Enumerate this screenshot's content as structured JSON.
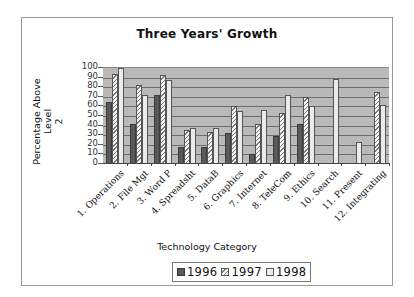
{
  "chart_data": {
    "type": "bar",
    "title": "Three Years' Growth",
    "xlabel": "Technology Category",
    "ylabel": "Percentage Above Level 2",
    "ylim": [
      0,
      100
    ],
    "yticks": [
      0,
      10,
      20,
      30,
      40,
      50,
      60,
      70,
      80,
      90,
      100
    ],
    "grid": true,
    "legend_position": "bottom",
    "categories": [
      "1. Operations",
      "2. File Mgt",
      "3. Word P",
      "4. Spreadsht",
      "5. DataB",
      "6. Graphics",
      "7. Internet",
      "8. TeleCom",
      "9. Ethics",
      "10. Search",
      "11. Present",
      "12. Integrating"
    ],
    "series": [
      {
        "name": "1996",
        "values": [
          65,
          42,
          72,
          18,
          18,
          32,
          10,
          29,
          42,
          0,
          0,
          0
        ]
      },
      {
        "name": "1997",
        "values": [
          94,
          82,
          93,
          35,
          33,
          60,
          42,
          53,
          70,
          0,
          0,
          75
        ]
      },
      {
        "name": "1998",
        "values": [
          100,
          72,
          88,
          38,
          38,
          55,
          56,
          72,
          60,
          89,
          23,
          61
        ]
      }
    ]
  },
  "labels": {
    "title": "Three Years' Growth",
    "ylabel_line1": "Percentage Above Level",
    "ylabel_line2": "2",
    "xlabel": "Technology Category",
    "legend": [
      "1996",
      "1997",
      "1998"
    ]
  },
  "colors": {
    "plot_bg": "#b9b9b9",
    "s1996": "#595959",
    "s1997_hatch": "#7a7a7a",
    "s1998": "#ebebeb"
  }
}
